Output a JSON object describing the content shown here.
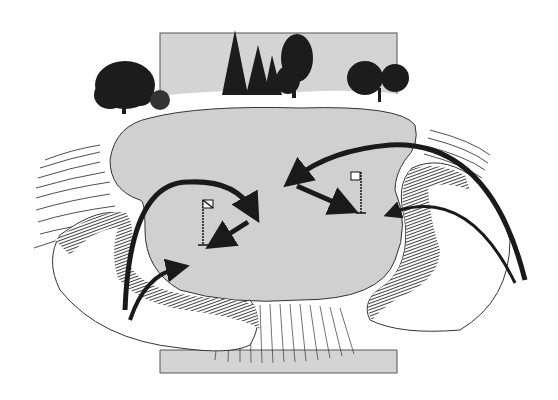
{
  "illustration": {
    "subject": "golf green with surrounding sand bunkers and shot-direction arrows",
    "colors": {
      "background": "#ffffff",
      "sky_panel": "#d4d4d4",
      "green": "#d0d0d0",
      "ink": "#1a1a1a",
      "sand": "#ffffff"
    },
    "flags": [
      {
        "id": "left-flag",
        "x": 203,
        "y": 200
      },
      {
        "id": "right-flag",
        "x": 357,
        "y": 172
      }
    ],
    "arrows": [
      {
        "id": "left-bunker-high-shot",
        "kind": "lofted"
      },
      {
        "id": "left-bunker-low-shot",
        "kind": "lofted"
      },
      {
        "id": "left-green-putt",
        "kind": "roll"
      },
      {
        "id": "right-bunker-long-shot",
        "kind": "lofted"
      },
      {
        "id": "right-bunker-short-shot",
        "kind": "lofted"
      },
      {
        "id": "right-green-putt",
        "kind": "roll"
      }
    ]
  }
}
